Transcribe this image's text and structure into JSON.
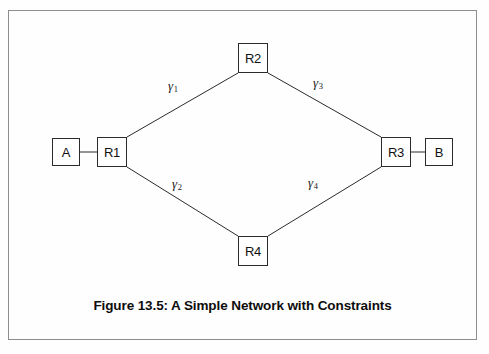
{
  "figure": {
    "caption": "Figure 13.5: A Simple Network with Constraints",
    "border_color": "#8d8d8d",
    "line_color": "#2b2b2b",
    "background": "#fefefe"
  },
  "nodes": [
    {
      "id": "A",
      "label": "A",
      "x": 52,
      "y": 138,
      "w": 28,
      "h": 28,
      "kind": "host"
    },
    {
      "id": "R1",
      "label": "R1",
      "x": 97,
      "y": 137,
      "w": 30,
      "h": 30,
      "kind": "router"
    },
    {
      "id": "R2",
      "label": "R2",
      "x": 238,
      "y": 43,
      "w": 30,
      "h": 30,
      "kind": "router"
    },
    {
      "id": "R3",
      "label": "R3",
      "x": 381,
      "y": 137,
      "w": 30,
      "h": 30,
      "kind": "router"
    },
    {
      "id": "R4",
      "label": "R4",
      "x": 238,
      "y": 236,
      "w": 30,
      "h": 30,
      "kind": "router"
    },
    {
      "id": "B",
      "label": "B",
      "x": 425,
      "y": 138,
      "w": 28,
      "h": 28,
      "kind": "host"
    }
  ],
  "edges": [
    {
      "id": "A-R1",
      "from": "A",
      "to": "R1",
      "label": "",
      "sub": "",
      "x1": 80,
      "y1": 152,
      "x2": 97,
      "y2": 152
    },
    {
      "id": "R1-R2",
      "from": "R1",
      "to": "R2",
      "label": "γ",
      "sub": "1",
      "x1": 127,
      "y1": 137,
      "x2": 238,
      "y2": 73
    },
    {
      "id": "R2-R3",
      "from": "R2",
      "to": "R3",
      "label": "γ",
      "sub": "3",
      "x1": 268,
      "y1": 73,
      "x2": 381,
      "y2": 137
    },
    {
      "id": "R1-R4",
      "from": "R1",
      "to": "R4",
      "label": "γ",
      "sub": "2",
      "x1": 127,
      "y1": 167,
      "x2": 238,
      "y2": 236
    },
    {
      "id": "R4-R3",
      "from": "R4",
      "to": "R3",
      "label": "γ",
      "sub": "4",
      "x1": 268,
      "y1": 236,
      "x2": 381,
      "y2": 167
    },
    {
      "id": "R3-B",
      "from": "R3",
      "to": "B",
      "label": "",
      "sub": "",
      "x1": 411,
      "y1": 152,
      "x2": 425,
      "y2": 152
    }
  ],
  "edge_labels": [
    {
      "id": "gamma-1",
      "text": "γ",
      "sub": "1",
      "x": 168,
      "y": 79
    },
    {
      "id": "gamma-3",
      "text": "γ",
      "sub": "3",
      "x": 313,
      "y": 76
    },
    {
      "id": "gamma-2",
      "text": "γ",
      "sub": "2",
      "x": 172,
      "y": 177
    },
    {
      "id": "gamma-4",
      "text": "γ",
      "sub": "4",
      "x": 308,
      "y": 176
    }
  ]
}
